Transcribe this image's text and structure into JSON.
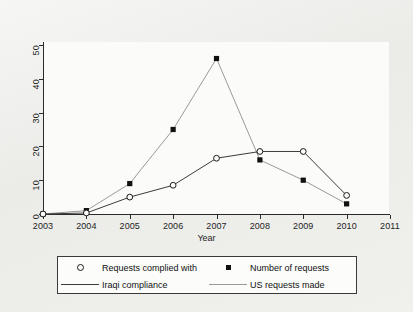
{
  "chart_data": {
    "type": "line",
    "title": "",
    "xlabel": "Year",
    "ylabel": "",
    "x": [
      2003,
      2004,
      2005,
      2006,
      2007,
      2008,
      2009,
      2010
    ],
    "xticks": [
      "2003",
      "2004",
      "2005",
      "2006",
      "2007",
      "2008",
      "2009",
      "2010",
      "2011"
    ],
    "yticks": [
      "0",
      "10",
      "20",
      "30",
      "40",
      "50"
    ],
    "xlim": [
      2003,
      2011
    ],
    "ylim": [
      0,
      50
    ],
    "grid": false,
    "legend_position": "below-axes",
    "series": [
      {
        "name": "Number of requests",
        "line_name": "US requests made",
        "marker": "filled-square",
        "color": "#9a9a9a",
        "marker_color": "#111111",
        "values": [
          0,
          1,
          9,
          25,
          46,
          16,
          10,
          3
        ]
      },
      {
        "name": "Requests complied with",
        "line_name": "Iraqi compliance",
        "marker": "open-circle",
        "color": "#3b3b3b",
        "marker_color": "#191919",
        "values": [
          0,
          0.3,
          5,
          8.5,
          16.5,
          18.5,
          18.5,
          5.5
        ]
      }
    ]
  },
  "legend": {
    "entries": [
      {
        "key": "open-circle",
        "label": "Requests complied with"
      },
      {
        "key": "filled-square",
        "label": "Number of requests"
      },
      {
        "key": "line-dark",
        "label": "Iraqi compliance"
      },
      {
        "key": "line-light",
        "label": "US requests made"
      }
    ]
  },
  "colors": {
    "page_background": "#ebebe8",
    "plot_background": "#fbfbfa",
    "axis": "#2b2b2b",
    "series_us": "#9a9a9a",
    "series_iraqi": "#3b3b3b"
  }
}
